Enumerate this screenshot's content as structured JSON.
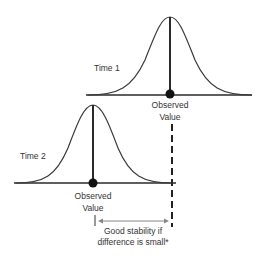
{
  "colors": {
    "line": "#2a2a2a",
    "curve": "#3a3a3a",
    "dot": "#111111",
    "arrow": "#888888",
    "text": "#333333",
    "background": "#ffffff"
  },
  "time1": {
    "label": "Time 1",
    "observed_label_line1": "Observed",
    "observed_label_line2": "Value"
  },
  "time2": {
    "label": "Time 2",
    "observed_label_line1": "Observed",
    "observed_label_line2": "Value"
  },
  "difference": {
    "caption_line1": "Good stability if",
    "caption_line2": "difference is small*"
  }
}
